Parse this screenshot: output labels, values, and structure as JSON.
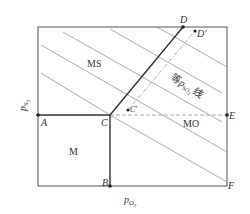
{
  "diagram": {
    "type": "predominance-area-diagram",
    "x_axis_label": {
      "main": "p",
      "sub": "O",
      "sub2": "2"
    },
    "y_axis_label": {
      "main": "p",
      "sub": "S",
      "sub2": "2"
    },
    "regions": {
      "ms": "MS",
      "mo": "MO",
      "m": "M"
    },
    "points": {
      "A": "A",
      "B": "B",
      "C": "C",
      "D": "D",
      "E": "E",
      "F": "F",
      "D_prime": "D′",
      "C_prime": "C′"
    },
    "iso_line_label": {
      "prefix": "等",
      "main": "p",
      "sub": "SO",
      "sub2": "2",
      "suffix": "线"
    },
    "colors": {
      "line": "#333333",
      "thin": "#777777",
      "dash": "#999999"
    }
  }
}
